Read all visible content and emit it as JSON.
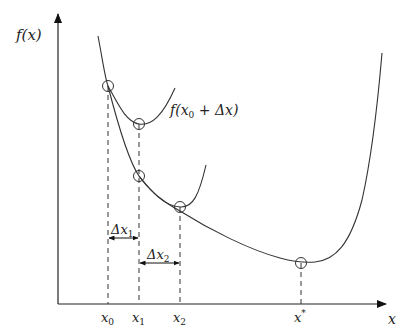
{
  "axes": {
    "y_label": "f(x)",
    "x_label": "x"
  },
  "curve_label": {
    "prefix": "f(x",
    "sub": "0",
    "suffix": " + Δx)"
  },
  "tick_labels": [
    {
      "base": "x",
      "sub": "0"
    },
    {
      "base": "x",
      "sub": "1"
    },
    {
      "base": "x",
      "sub": "2"
    },
    {
      "base": "x",
      "sup": "*"
    }
  ],
  "intervals": [
    {
      "base": "Δx",
      "sub": "1"
    },
    {
      "base": "Δx",
      "sub": "2"
    }
  ],
  "colors": {
    "line": "#333333",
    "background": "#ffffff"
  }
}
